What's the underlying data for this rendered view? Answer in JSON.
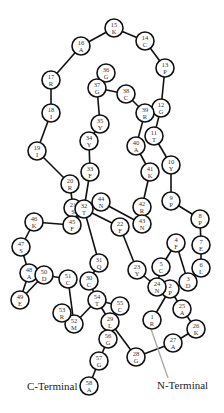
{
  "diagram": {
    "type": "protein-topology",
    "radius": 9,
    "nodes": [
      {
        "id": 1,
        "aa": "R",
        "x": 152,
        "y": 320
      },
      {
        "id": 2,
        "aa": "P",
        "x": 170,
        "y": 289
      },
      {
        "id": 3,
        "aa": "D",
        "x": 188,
        "y": 282
      },
      {
        "id": 4,
        "aa": "F",
        "x": 176,
        "y": 243
      },
      {
        "id": 5,
        "aa": "C",
        "x": 161,
        "y": 267
      },
      {
        "id": 6,
        "aa": "L",
        "x": 201,
        "y": 268
      },
      {
        "id": 7,
        "aa": "E",
        "x": 201,
        "y": 245
      },
      {
        "id": 8,
        "aa": "P",
        "x": 200,
        "y": 219
      },
      {
        "id": 9,
        "aa": "P",
        "x": 171,
        "y": 201
      },
      {
        "id": 10,
        "aa": "Y",
        "x": 171,
        "y": 165
      },
      {
        "id": 11,
        "aa": "T",
        "x": 154,
        "y": 136
      },
      {
        "id": 12,
        "aa": "G",
        "x": 161,
        "y": 108
      },
      {
        "id": 13,
        "aa": "P",
        "x": 165,
        "y": 68
      },
      {
        "id": 14,
        "aa": "C",
        "x": 145,
        "y": 41
      },
      {
        "id": 15,
        "aa": "K",
        "x": 114,
        "y": 28
      },
      {
        "id": 16,
        "aa": "A",
        "x": 81,
        "y": 46
      },
      {
        "id": 17,
        "aa": "R",
        "x": 51,
        "y": 80
      },
      {
        "id": 18,
        "aa": "I",
        "x": 51,
        "y": 113
      },
      {
        "id": 19,
        "aa": "I",
        "x": 37,
        "y": 151
      },
      {
        "id": 20,
        "aa": "R",
        "x": 70,
        "y": 184
      },
      {
        "id": 21,
        "aa": "S",
        "x": 73,
        "y": 208
      },
      {
        "id": 22,
        "aa": "F",
        "x": 120,
        "y": 227
      },
      {
        "id": 23,
        "aa": "Y",
        "x": 137,
        "y": 270
      },
      {
        "id": 24,
        "aa": "N",
        "x": 157,
        "y": 287
      },
      {
        "id": 25,
        "aa": "A",
        "x": 182,
        "y": 309
      },
      {
        "id": 26,
        "aa": "K",
        "x": 196,
        "y": 329
      },
      {
        "id": 27,
        "aa": "A",
        "x": 173,
        "y": 343
      },
      {
        "id": 28,
        "aa": "G",
        "x": 136,
        "y": 357
      },
      {
        "id": 29,
        "aa": "L",
        "x": 110,
        "y": 322
      },
      {
        "id": 30,
        "aa": "C",
        "x": 89,
        "y": 281
      },
      {
        "id": 31,
        "aa": "Q",
        "x": 99,
        "y": 263
      },
      {
        "id": 32,
        "aa": "T",
        "x": 84,
        "y": 209
      },
      {
        "id": 33,
        "aa": "F",
        "x": 90,
        "y": 172
      },
      {
        "id": 34,
        "aa": "Y",
        "x": 89,
        "y": 141
      },
      {
        "id": 35,
        "aa": "Y",
        "x": 100,
        "y": 124
      },
      {
        "id": 36,
        "aa": "G",
        "x": 106,
        "y": 73
      },
      {
        "id": 37,
        "aa": "G",
        "x": 97,
        "y": 88
      },
      {
        "id": 38,
        "aa": "C",
        "x": 126,
        "y": 94
      },
      {
        "id": 39,
        "aa": "R",
        "x": 145,
        "y": 113
      },
      {
        "id": 40,
        "aa": "A",
        "x": 136,
        "y": 146
      },
      {
        "id": 41,
        "aa": "K",
        "x": 150,
        "y": 172
      },
      {
        "id": 42,
        "aa": "R",
        "x": 142,
        "y": 207
      },
      {
        "id": 43,
        "aa": "N",
        "x": 142,
        "y": 224
      },
      {
        "id": 44,
        "aa": "N",
        "x": 101,
        "y": 202
      },
      {
        "id": 45,
        "aa": "F",
        "x": 72,
        "y": 225
      },
      {
        "id": 46,
        "aa": "K",
        "x": 34,
        "y": 222
      },
      {
        "id": 47,
        "aa": "S",
        "x": 21,
        "y": 247
      },
      {
        "id": 48,
        "aa": "A",
        "x": 29,
        "y": 273
      },
      {
        "id": 49,
        "aa": "E",
        "x": 20,
        "y": 300
      },
      {
        "id": 50,
        "aa": "D",
        "x": 44,
        "y": 275
      },
      {
        "id": 51,
        "aa": "C",
        "x": 68,
        "y": 279
      },
      {
        "id": 52,
        "aa": "M",
        "x": 74,
        "y": 324
      },
      {
        "id": 53,
        "aa": "R",
        "x": 62,
        "y": 313
      },
      {
        "id": 54,
        "aa": "T",
        "x": 97,
        "y": 300
      },
      {
        "id": 55,
        "aa": "C",
        "x": 120,
        "y": 306
      },
      {
        "id": 56,
        "aa": "G",
        "x": 108,
        "y": 339
      },
      {
        "id": 57,
        "aa": "G",
        "x": 99,
        "y": 361
      },
      {
        "id": 58,
        "aa": "A",
        "x": 89,
        "y": 386
      }
    ],
    "edges": [
      [
        1,
        2
      ],
      [
        2,
        3
      ],
      [
        3,
        4
      ],
      [
        4,
        5
      ],
      [
        3,
        6
      ],
      [
        6,
        7
      ],
      [
        7,
        8
      ],
      [
        8,
        9
      ],
      [
        9,
        10
      ],
      [
        10,
        11
      ],
      [
        11,
        12
      ],
      [
        12,
        13
      ],
      [
        13,
        14
      ],
      [
        14,
        15
      ],
      [
        15,
        16
      ],
      [
        16,
        17
      ],
      [
        17,
        18
      ],
      [
        18,
        19
      ],
      [
        19,
        20
      ],
      [
        20,
        21
      ],
      [
        21,
        32
      ],
      [
        32,
        22
      ],
      [
        22,
        23
      ],
      [
        23,
        24
      ],
      [
        24,
        2
      ],
      [
        2,
        25
      ],
      [
        25,
        26
      ],
      [
        26,
        27
      ],
      [
        27,
        28
      ],
      [
        28,
        29
      ],
      [
        29,
        54
      ],
      [
        54,
        30
      ],
      [
        30,
        31
      ],
      [
        31,
        32
      ],
      [
        32,
        33
      ],
      [
        33,
        34
      ],
      [
        34,
        35
      ],
      [
        35,
        37
      ],
      [
        37,
        36
      ],
      [
        37,
        38
      ],
      [
        38,
        39
      ],
      [
        39,
        12
      ],
      [
        39,
        40
      ],
      [
        40,
        41
      ],
      [
        41,
        42
      ],
      [
        42,
        43
      ],
      [
        43,
        44
      ],
      [
        44,
        32
      ],
      [
        32,
        45
      ],
      [
        45,
        46
      ],
      [
        46,
        47
      ],
      [
        47,
        48
      ],
      [
        48,
        49
      ],
      [
        49,
        50
      ],
      [
        48,
        50
      ],
      [
        50,
        51
      ],
      [
        51,
        52
      ],
      [
        52,
        53
      ],
      [
        52,
        54
      ],
      [
        54,
        55
      ],
      [
        29,
        56
      ],
      [
        56,
        57
      ],
      [
        57,
        58
      ],
      [
        5,
        24
      ]
    ],
    "labels": {
      "n_terminal": "N-Terminal",
      "c_terminal": "C-Terminal"
    },
    "colors": {
      "node_stroke": "#111111",
      "node_fill": "#ffffff",
      "terminal_line": "#aaaaaa"
    }
  }
}
